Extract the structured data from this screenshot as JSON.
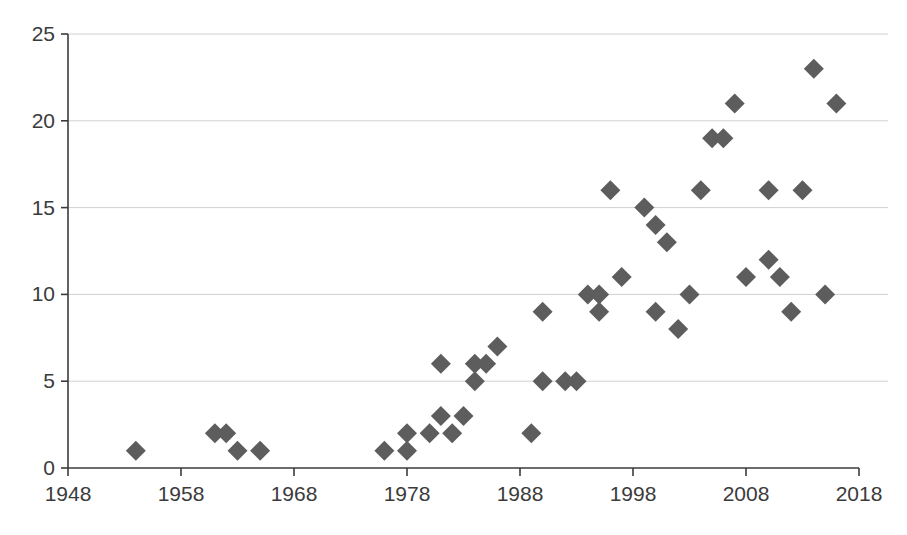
{
  "chart_data": {
    "type": "scatter",
    "title": "",
    "subtitle": "",
    "xlabel": "",
    "ylabel": "",
    "xlim": [
      1948,
      2018
    ],
    "ylim": [
      0,
      25
    ],
    "xticks": [
      1948,
      1958,
      1968,
      1978,
      1988,
      1998,
      2008,
      2018
    ],
    "yticks": [
      0,
      5,
      10,
      15,
      20,
      25
    ],
    "grid": "horizontal",
    "legend": "none",
    "marker": "diamond",
    "marker_color": "#5d5d5d",
    "marker_size": 13,
    "axis_color": "#3b3b3b",
    "grid_color": "#d0d0d0",
    "series": [
      {
        "name": "series-1",
        "points": [
          {
            "x": 1954,
            "y": 1
          },
          {
            "x": 1961,
            "y": 2
          },
          {
            "x": 1962,
            "y": 2
          },
          {
            "x": 1963,
            "y": 1
          },
          {
            "x": 1965,
            "y": 1
          },
          {
            "x": 1976,
            "y": 1
          },
          {
            "x": 1978,
            "y": 2
          },
          {
            "x": 1978,
            "y": 1
          },
          {
            "x": 1980,
            "y": 2
          },
          {
            "x": 1981,
            "y": 3
          },
          {
            "x": 1981,
            "y": 6
          },
          {
            "x": 1982,
            "y": 2
          },
          {
            "x": 1983,
            "y": 3
          },
          {
            "x": 1984,
            "y": 6
          },
          {
            "x": 1984,
            "y": 5
          },
          {
            "x": 1985,
            "y": 6
          },
          {
            "x": 1986,
            "y": 7
          },
          {
            "x": 1989,
            "y": 2
          },
          {
            "x": 1990,
            "y": 5
          },
          {
            "x": 1990,
            "y": 9
          },
          {
            "x": 1992,
            "y": 5
          },
          {
            "x": 1993,
            "y": 5
          },
          {
            "x": 1994,
            "y": 10
          },
          {
            "x": 1995,
            "y": 10
          },
          {
            "x": 1995,
            "y": 9
          },
          {
            "x": 1996,
            "y": 16
          },
          {
            "x": 1997,
            "y": 11
          },
          {
            "x": 1999,
            "y": 15
          },
          {
            "x": 2000,
            "y": 14
          },
          {
            "x": 2001,
            "y": 13
          },
          {
            "x": 2000,
            "y": 9
          },
          {
            "x": 2002,
            "y": 8
          },
          {
            "x": 2003,
            "y": 10
          },
          {
            "x": 2004,
            "y": 16
          },
          {
            "x": 2005,
            "y": 19
          },
          {
            "x": 2006,
            "y": 19
          },
          {
            "x": 2007,
            "y": 21
          },
          {
            "x": 2008,
            "y": 11
          },
          {
            "x": 2010,
            "y": 12
          },
          {
            "x": 2010,
            "y": 16
          },
          {
            "x": 2011,
            "y": 11
          },
          {
            "x": 2012,
            "y": 9
          },
          {
            "x": 2013,
            "y": 16
          },
          {
            "x": 2014,
            "y": 23
          },
          {
            "x": 2015,
            "y": 10
          },
          {
            "x": 2016,
            "y": 21
          }
        ]
      }
    ]
  },
  "axes": {
    "y_labels": [
      "25",
      "20",
      "15",
      "10",
      "5",
      "0"
    ],
    "x_labels": [
      "1948",
      "1958",
      "1968",
      "1978",
      "1988",
      "1998",
      "2008",
      "2018"
    ]
  }
}
